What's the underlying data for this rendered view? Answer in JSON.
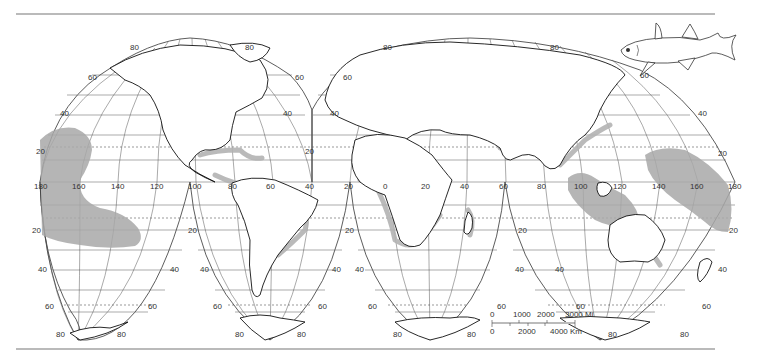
{
  "map": {
    "projection": "Goode homolosine (interrupted)",
    "latitude_labels": {
      "north": [
        "80",
        "60",
        "40",
        "20"
      ],
      "south": [
        "20",
        "40",
        "60",
        "80"
      ]
    },
    "longitude_labels": {
      "pacific_west": [
        "180",
        "160",
        "140",
        "120",
        "100"
      ],
      "americas": [
        "80",
        "60",
        "40",
        "20"
      ],
      "africa": [
        "0",
        "20",
        "40",
        "60"
      ],
      "asia_pacific": [
        "80",
        "100",
        "120",
        "140",
        "160",
        "180"
      ]
    },
    "lobe_labels": {
      "l1_n80": "80",
      "l1_n60": "60",
      "l1_n40": "40",
      "l1_n20": "20",
      "l1_r80": "80",
      "l1_r60": "60",
      "l1_r40": "40",
      "l1_r20": "20",
      "l2_n60": "60",
      "l2_n40": "40",
      "l2_r80": "80",
      "l2_r60": "60",
      "l2_r40": "40",
      "l2_r20": "20",
      "s1_20": "20",
      "s1_40": "40",
      "s1_60": "60",
      "s1_80": "80",
      "s1_r20": "20",
      "s1_r40": "40",
      "s1_r60": "60",
      "s1_r80": "80",
      "s2_20": "20",
      "s2_40": "40",
      "s2_60": "60",
      "s2_80": "80",
      "s2_r20": "20",
      "s2_r40": "40",
      "s2_r60": "60",
      "s2_r80": "80",
      "s3_40": "40",
      "s3_60": "60",
      "s3_80": "80",
      "s3_r20": "20",
      "s3_r40": "40",
      "s3_r60": "60",
      "s3_r80": "80",
      "s4_40": "40",
      "s4_60": "60",
      "s4_80": "80",
      "s4_r20": "20",
      "s4_r40": "40",
      "s4_r60": "60",
      "s4_r80": "80",
      "eq_180": "180",
      "eq_160": "160",
      "eq_140": "140",
      "eq_120": "120",
      "eq_100": "100",
      "eq_80a": "80",
      "eq_60a": "60",
      "eq_40a": "40",
      "eq_20a": "20",
      "eq_0": "0",
      "eq_20b": "20",
      "eq_40b": "40",
      "eq_60b": "60",
      "eq_80b": "80",
      "eq_100b": "100",
      "eq_120b": "120",
      "eq_140b": "140",
      "eq_160b": "160",
      "eq_180b": "180"
    },
    "scale_bar": {
      "miles_labels": [
        "0",
        "1000",
        "2000",
        "3000 Mi"
      ],
      "km_labels": [
        "0",
        "2000",
        "4000 Km"
      ]
    },
    "colors": {
      "range_fill": "#a8a8a8",
      "land_stroke": "#111111",
      "graticule": "#555555",
      "rule": "#777777"
    },
    "illustration": "fish"
  }
}
